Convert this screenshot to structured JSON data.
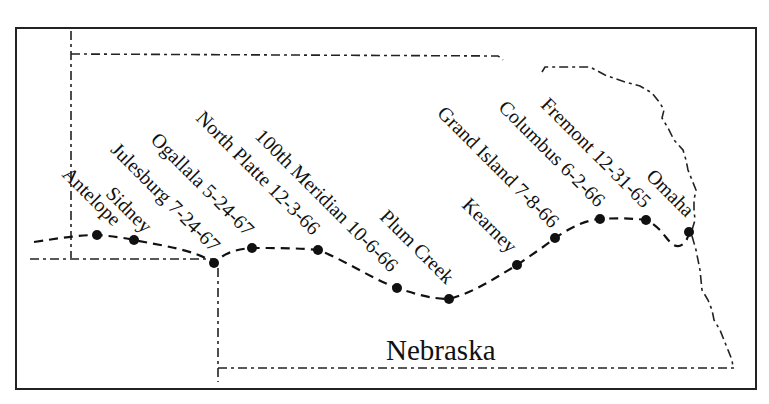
{
  "map": {
    "state_label": "Nebraska",
    "stations": [
      {
        "name": "Antelope",
        "label": "Antelope"
      },
      {
        "name": "Sidney",
        "label": "Sidney"
      },
      {
        "name": "Julesburg",
        "label": "Julesburg 7-24-67"
      },
      {
        "name": "Ogallala",
        "label": "Ogallala 5-24-67"
      },
      {
        "name": "North Platte",
        "label": "North Platte 12-3-66"
      },
      {
        "name": "100th Meridian",
        "label": "100th Meridian 10-6-66"
      },
      {
        "name": "Plum Creek",
        "label": "Plum Creek"
      },
      {
        "name": "Kearney",
        "label": "Kearney"
      },
      {
        "name": "Grand Island",
        "label": "Grand Island 7-8-66"
      },
      {
        "name": "Columbus",
        "label": "Columbus 6-2-66"
      },
      {
        "name": "Fremont",
        "label": "Fremont 12-31-65"
      },
      {
        "name": "Omaha",
        "label": "Omaha"
      }
    ],
    "colors": {
      "ink": "#111111",
      "background": "#ffffff"
    }
  }
}
